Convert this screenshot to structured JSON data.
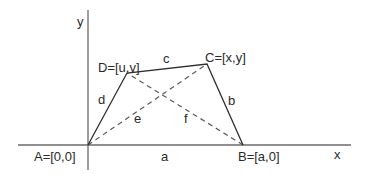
{
  "diagram": {
    "type": "quadrilateral-coordinate-figure",
    "axes": {
      "x_label": "x",
      "y_label": "y"
    },
    "points": {
      "A": {
        "label": "A=[0,0]"
      },
      "B": {
        "label": "B=[a,0]"
      },
      "C": {
        "label": "C=[x,y]"
      },
      "D": {
        "label": "D=[u,v]"
      }
    },
    "sides": {
      "AB": {
        "label": "a",
        "style": "solid"
      },
      "BC": {
        "label": "b",
        "style": "solid"
      },
      "CD": {
        "label": "c",
        "style": "solid"
      },
      "DA": {
        "label": "d",
        "style": "solid"
      }
    },
    "diagonals": {
      "AC": {
        "label": "e",
        "style": "dashed"
      },
      "BD": {
        "label": "f",
        "style": "dashed"
      }
    },
    "colors": {
      "background": "#ffffff",
      "lines": "#2f2f2f",
      "axes": "#6a6a6a",
      "text": "#2a2a2a"
    }
  }
}
